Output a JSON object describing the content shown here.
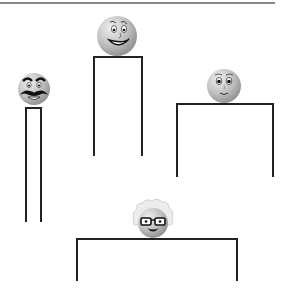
{
  "figure": {
    "colors": {
      "line": "#222222",
      "rule": "#8a8a8a",
      "face_fill": "#bdbdbd",
      "face_highlight": "#e6e6e6",
      "feature": "#1a1a1a",
      "hair": "#e8e8e8"
    },
    "top_rule": {
      "x": 0,
      "y": 2,
      "width": 275
    },
    "characters": [
      {
        "id": "mustache",
        "label": "Face with mustache and bushy eyebrows",
        "face": {
          "cx": 34,
          "cy": 89,
          "r": 16
        },
        "box": {
          "left": 25,
          "top": 107,
          "right": 42,
          "bottom": 222
        }
      },
      {
        "id": "big-smile",
        "label": "Face with big smile",
        "face": {
          "cx": 117,
          "cy": 36,
          "r": 20
        },
        "box": {
          "left": 93,
          "top": 56,
          "right": 143,
          "bottom": 156
        }
      },
      {
        "id": "small-smile",
        "label": "Face with small smile",
        "face": {
          "cx": 224,
          "cy": 86,
          "r": 17
        },
        "box": {
          "left": 176,
          "top": 103,
          "right": 274,
          "bottom": 177
        }
      },
      {
        "id": "glasses",
        "label": "Face with glasses and wild white hair",
        "face": {
          "cx": 153,
          "cy": 223,
          "r": 15
        },
        "box": {
          "left": 76,
          "top": 238,
          "right": 238,
          "bottom": 281
        }
      }
    ]
  }
}
